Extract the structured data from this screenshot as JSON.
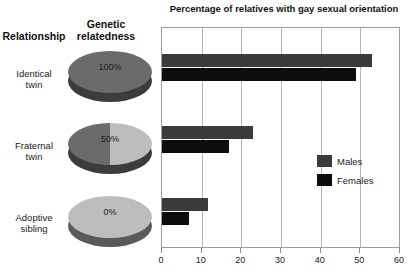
{
  "table": {
    "headers": {
      "relationship": "Relationship",
      "relatedness_line1": "Genetic",
      "relatedness_line2": "relatedness"
    },
    "rows": [
      {
        "label_line1": "Identical",
        "label_line2": "twin",
        "relatedness_pct": "100%",
        "pie_left_color": "#6b6b6b",
        "pie_right_color": "#6b6b6b",
        "pie_side_color": "#3c3c3c"
      },
      {
        "label_line1": "Fraternal",
        "label_line2": "twin",
        "relatedness_pct": "50%",
        "pie_left_color": "#6b6b6b",
        "pie_right_color": "#bdbdbd",
        "pie_side_color": "#3c3c3c"
      },
      {
        "label_line1": "Adoptive",
        "label_line2": "sibling",
        "relatedness_pct": "0%",
        "pie_left_color": "#bdbdbd",
        "pie_right_color": "#bdbdbd",
        "pie_side_color": "#5a5a5a"
      }
    ]
  },
  "legend": {
    "males_label": "Males",
    "females_label": "Females",
    "males_color": "#3a3a3a",
    "females_color": "#0d0d0d"
  },
  "chart_data": {
    "type": "bar",
    "orientation": "horizontal",
    "title": "Percentage of relatives with gay sexual orientation",
    "xlabel": "",
    "ylabel": "",
    "categories": [
      "Identical twin",
      "Fraternal twin",
      "Adoptive sibling"
    ],
    "series": [
      {
        "name": "Males",
        "values": [
          53,
          23,
          11.5
        ],
        "color": "#3a3a3a"
      },
      {
        "name": "Females",
        "values": [
          49,
          17,
          6.8
        ],
        "color": "#0d0d0d"
      }
    ],
    "xlim": [
      0,
      60
    ],
    "xticks": [
      0,
      10,
      20,
      30,
      40,
      50,
      60
    ],
    "xtick_labels": [
      "0",
      "10",
      "20",
      "30",
      "40",
      "50",
      "60"
    ],
    "grid": true,
    "grid_axis": "x",
    "legend_position": "center-right"
  }
}
